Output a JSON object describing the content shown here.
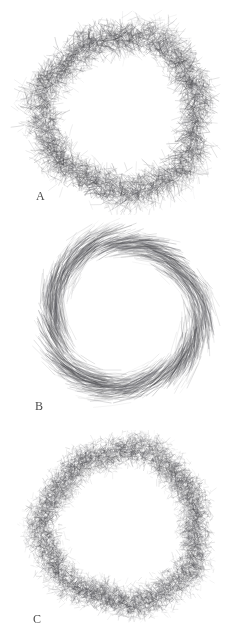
{
  "figure": {
    "background_color": "#ffffff",
    "ink_color": "#555555",
    "width": 243,
    "height": 644,
    "panel_count": 3
  },
  "panels": [
    {
      "id": "A",
      "label": "A",
      "label_x": 36,
      "label_y": 190,
      "shape": "annulus",
      "center_x": 122,
      "center_y": 113,
      "outer_radius": 100,
      "inner_radius": 57,
      "texture": "short-spiky-bristles",
      "stroke_count": 5200,
      "stroke_length_min": 3,
      "stroke_length_max": 13,
      "stroke_width": 0.55,
      "tangential_bias": 0.35,
      "ink_opacity": 0.5,
      "seed": 11
    },
    {
      "id": "B",
      "label": "B",
      "label_x": 35,
      "label_y": 400,
      "shape": "annulus",
      "center_x": 124,
      "center_y": 315,
      "outer_radius": 90,
      "inner_radius": 55,
      "texture": "long-flowing-strands",
      "stroke_count": 1700,
      "stroke_length_min": 12,
      "stroke_length_max": 40,
      "stroke_width": 0.6,
      "tangential_bias": 0.92,
      "ink_opacity": 0.42,
      "seed": 27
    },
    {
      "id": "C",
      "label": "C",
      "label_x": 33,
      "label_y": 613,
      "shape": "annulus",
      "center_x": 122,
      "center_y": 527,
      "outer_radius": 97,
      "inner_radius": 57,
      "texture": "fine-dense-bristles",
      "stroke_count": 9000,
      "stroke_length_min": 2,
      "stroke_length_max": 7,
      "stroke_width": 0.45,
      "tangential_bias": 0.2,
      "ink_opacity": 0.55,
      "seed": 43
    }
  ]
}
